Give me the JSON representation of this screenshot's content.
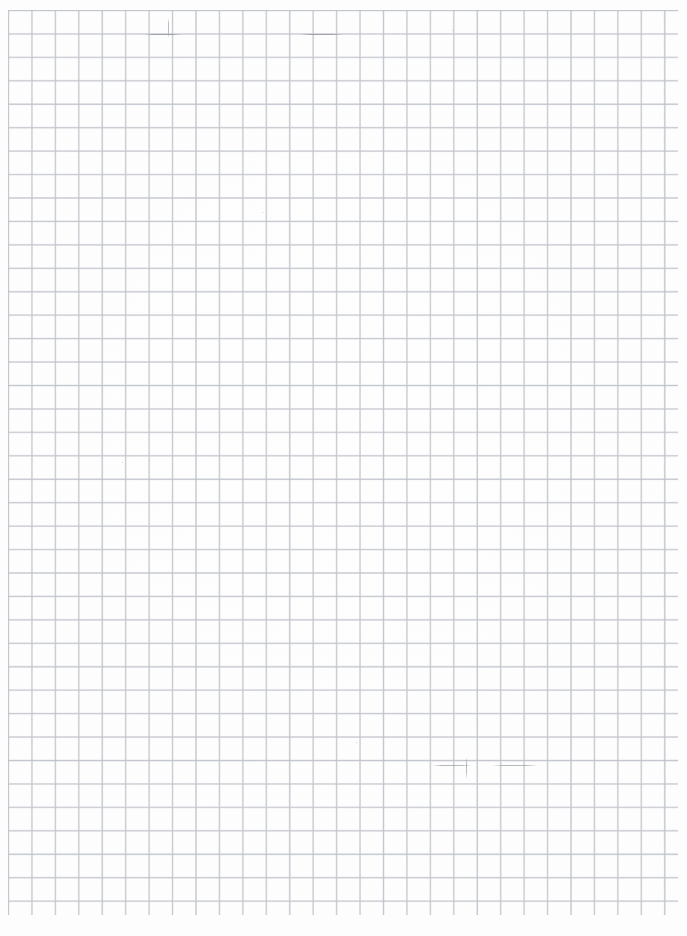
{
  "document": {
    "kind": "scanned-grid-paper",
    "title": "Blank grid paper scan",
    "page_width_px": 687,
    "page_height_px": 936,
    "visible_text": "",
    "has_text": false,
    "has_handwriting": false
  },
  "colors": {
    "page_background": "#fefefe",
    "grid_line": "#a9acb4",
    "grid_line_soft": "#c4c7ce",
    "grid_line_tint": "#b2bac8",
    "artifact_mark": "#787c84"
  },
  "grid": {
    "type": "square",
    "cell_size_px": 23.45,
    "line_width_px": 1,
    "origin_x_px": 8,
    "origin_y_px": 10,
    "extent_width_px": 670,
    "extent_height_px": 905,
    "columns": 28,
    "rows": 38,
    "major_every": 4,
    "has_margin_rule": false,
    "has_page_numbers": false
  },
  "artifacts": [
    {
      "name": "vertical-scan-stroke-top",
      "shape": "vstroke",
      "x": 168,
      "y": 18,
      "w": 1,
      "h": 20
    },
    {
      "name": "horizontal-scan-stroke-top",
      "shape": "hstroke",
      "x": 300,
      "y": 34,
      "w": 44,
      "h": 1
    },
    {
      "name": "horizontal-scan-stroke-upper",
      "shape": "hstroke",
      "x": 144,
      "y": 34,
      "w": 38,
      "h": 1
    },
    {
      "name": "horizontal-scan-stroke-mid-left",
      "shape": "hstroke",
      "x": 432,
      "y": 765,
      "w": 40,
      "h": 1
    },
    {
      "name": "horizontal-scan-stroke-mid-right",
      "shape": "hstroke",
      "x": 492,
      "y": 765,
      "w": 46,
      "h": 1
    },
    {
      "name": "vertical-scan-stroke-bottom",
      "shape": "vstroke",
      "x": 466,
      "y": 757,
      "w": 1,
      "h": 22
    },
    {
      "name": "speck-upper-right",
      "shape": "speck",
      "x": 452,
      "y": 30,
      "w": 1,
      "h": 1
    },
    {
      "name": "speck-mid-left",
      "shape": "speck",
      "x": 122,
      "y": 462,
      "w": 1,
      "h": 1
    },
    {
      "name": "speck-lower-center",
      "shape": "speck",
      "x": 356,
      "y": 742,
      "w": 1,
      "h": 1
    },
    {
      "name": "speck-upper-center",
      "shape": "speck",
      "x": 262,
      "y": 212,
      "w": 1,
      "h": 1
    }
  ]
}
